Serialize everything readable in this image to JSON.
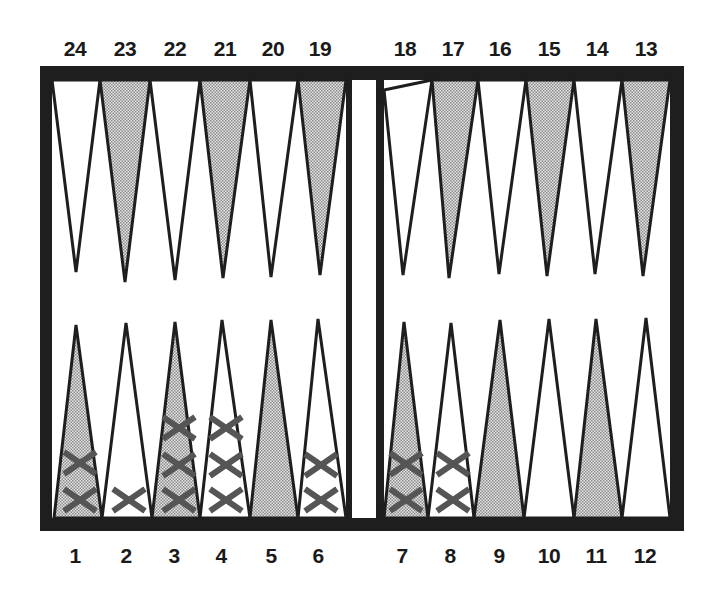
{
  "board": {
    "frame_color": "#1e1e1e",
    "light_point_color": "#ffffff",
    "dark_point_color": "#c4c4c4",
    "checker_color": "#555555",
    "checker_symbol": "X"
  },
  "top_labels": [
    "24",
    "23",
    "22",
    "21",
    "20",
    "19",
    "18",
    "17",
    "16",
    "15",
    "14",
    "13"
  ],
  "bottom_labels": [
    "1",
    "2",
    "3",
    "4",
    "5",
    "6",
    "7",
    "8",
    "9",
    "10",
    "11",
    "12"
  ],
  "points": {
    "top": [
      {
        "number": "24",
        "shade": "light",
        "checkers": 0
      },
      {
        "number": "23",
        "shade": "dark",
        "checkers": 0
      },
      {
        "number": "22",
        "shade": "light",
        "checkers": 0
      },
      {
        "number": "21",
        "shade": "dark",
        "checkers": 0
      },
      {
        "number": "20",
        "shade": "light",
        "checkers": 0
      },
      {
        "number": "19",
        "shade": "dark",
        "checkers": 0
      },
      {
        "number": "18",
        "shade": "light",
        "checkers": 0
      },
      {
        "number": "17",
        "shade": "dark",
        "checkers": 0
      },
      {
        "number": "16",
        "shade": "light",
        "checkers": 0
      },
      {
        "number": "15",
        "shade": "dark",
        "checkers": 0
      },
      {
        "number": "14",
        "shade": "light",
        "checkers": 0
      },
      {
        "number": "13",
        "shade": "dark",
        "checkers": 0
      }
    ],
    "bottom": [
      {
        "number": "1",
        "shade": "dark",
        "checkers": 2
      },
      {
        "number": "2",
        "shade": "light",
        "checkers": 1
      },
      {
        "number": "3",
        "shade": "dark",
        "checkers": 3
      },
      {
        "number": "4",
        "shade": "light",
        "checkers": 3
      },
      {
        "number": "5",
        "shade": "dark",
        "checkers": 0
      },
      {
        "number": "6",
        "shade": "light",
        "checkers": 2
      },
      {
        "number": "7",
        "shade": "dark",
        "checkers": 2
      },
      {
        "number": "8",
        "shade": "light",
        "checkers": 2
      },
      {
        "number": "9",
        "shade": "dark",
        "checkers": 0
      },
      {
        "number": "10",
        "shade": "light",
        "checkers": 0
      },
      {
        "number": "11",
        "shade": "dark",
        "checkers": 0
      },
      {
        "number": "12",
        "shade": "light",
        "checkers": 0
      }
    ]
  },
  "total_checkers": 15
}
